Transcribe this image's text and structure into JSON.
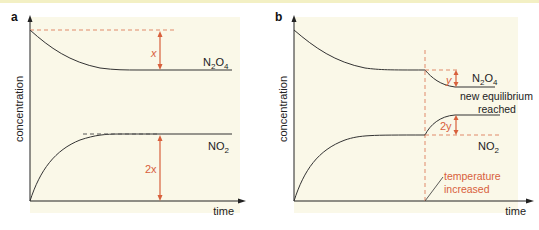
{
  "colors": {
    "panel_bg": "#faf8e8",
    "curve": "#333333",
    "annotation": "#d8603c",
    "dashed": "#e08a6a",
    "top_border": "#f3f0c4"
  },
  "panel_a": {
    "letter": "a",
    "ylabel": "concentration",
    "xlabel": "time",
    "species_top": {
      "base": "N",
      "sub1": "2",
      "mid": "O",
      "sub2": "4"
    },
    "species_bottom": {
      "base": "NO",
      "sub": "2"
    },
    "change_top": "x",
    "change_bottom": "2x"
  },
  "panel_b": {
    "letter": "b",
    "ylabel": "concentration",
    "xlabel": "time",
    "species_top": {
      "base": "N",
      "sub1": "2",
      "mid": "O",
      "sub2": "4"
    },
    "species_bottom": {
      "base": "NO",
      "sub": "2"
    },
    "change_top": "y",
    "change_bottom": "2y",
    "note_equilibrium_line1": "new equilibrium",
    "note_equilibrium_line2": "reached",
    "note_temperature_line1": "temperature",
    "note_temperature_line2": "increased"
  }
}
